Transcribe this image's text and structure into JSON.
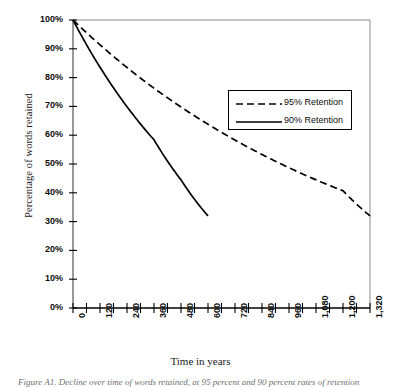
{
  "figure": {
    "caption": "Figure A1. Decline over time of words retained, at 95 percent and 90 percent rates of retention"
  },
  "chart_data": {
    "type": "line",
    "title": "",
    "xlabel": "Time in years",
    "ylabel": "Percentage of words retained",
    "xlim": [
      0,
      1320
    ],
    "ylim": [
      0,
      100
    ],
    "grid": false,
    "legend_position": "upper-right-inside",
    "x_tick_labels": [
      "0",
      "120",
      "240",
      "360",
      "480",
      "600",
      "720",
      "840",
      "960",
      "1,080",
      "1,200",
      "1,320"
    ],
    "x_tick_values": [
      0,
      120,
      240,
      360,
      480,
      600,
      720,
      840,
      960,
      1080,
      1200,
      1320
    ],
    "x_minor_tick_step": 60,
    "y_tick_labels": [
      "0%",
      "10%",
      "20%",
      "30%",
      "40%",
      "50%",
      "60%",
      "70%",
      "80%",
      "90%",
      "100%"
    ],
    "y_tick_values": [
      0,
      10,
      20,
      30,
      40,
      50,
      60,
      70,
      80,
      90,
      100
    ],
    "series": [
      {
        "name": "95% Retention",
        "style": "dashed",
        "color": "#000000",
        "x": [
          0,
          120,
          240,
          360,
          480,
          600,
          720,
          840,
          960,
          1080,
          1200,
          1320
        ],
        "values": [
          100,
          91.4,
          83.5,
          76.3,
          69.8,
          63.8,
          58.3,
          53.3,
          48.7,
          44.5,
          40.7,
          32.0
        ]
      },
      {
        "name": "90% Retention",
        "style": "solid",
        "color": "#000000",
        "x": [
          0,
          120,
          240,
          360,
          480,
          600
        ],
        "values": [
          100,
          83.6,
          69.9,
          58.4,
          44.5,
          32.0
        ]
      }
    ]
  },
  "legend": {
    "entries": [
      {
        "label": "95% Retention",
        "style": "dashed"
      },
      {
        "label": "90% Retention",
        "style": "solid"
      }
    ]
  }
}
